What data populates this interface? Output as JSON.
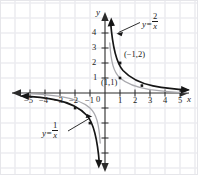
{
  "figure": {
    "kind": "cartesian-graph",
    "background_color": "#ffffff",
    "grid_color": "#ededf0",
    "axis_color": "#2b2b2b",
    "border_color": "#e6e6ea"
  },
  "axes": {
    "x_name": "x",
    "y_name": "y",
    "origin_label": "0",
    "x_ticks": [
      {
        "value": -5,
        "label": "−5"
      },
      {
        "value": -4,
        "label": "−4"
      },
      {
        "value": -3,
        "label": "−3"
      },
      {
        "value": -2,
        "label": "−2"
      },
      {
        "value": -1,
        "label": "−1"
      },
      {
        "value": 1,
        "label": "1"
      },
      {
        "value": 2,
        "label": "2"
      },
      {
        "value": 3,
        "label": "3"
      },
      {
        "value": 4,
        "label": "4"
      },
      {
        "value": 5,
        "label": "5"
      }
    ],
    "y_ticks": [
      {
        "value": 4,
        "label": "4"
      },
      {
        "value": 3,
        "label": "3"
      },
      {
        "value": 2,
        "label": "2"
      },
      {
        "value": 1,
        "label": "1"
      },
      {
        "value": -1,
        "label": ""
      },
      {
        "value": -2,
        "label": ""
      },
      {
        "value": -3,
        "label": ""
      },
      {
        "value": -4,
        "label": ""
      }
    ],
    "xlim": [
      -6.6,
      6.1
    ],
    "ylim": [
      -5.2,
      5.3
    ],
    "grid": true
  },
  "curves": [
    {
      "name": "y = 2/x",
      "label_numerator": "2",
      "label_denominator": "x",
      "label_lhs": "y",
      "label_eq": "=",
      "color": "#161616",
      "width": 1.6,
      "a": 2
    },
    {
      "name": "y = 1/x",
      "label_numerator": "1",
      "label_denominator": "x",
      "label_lhs": "y",
      "label_eq": "=",
      "color": "#a9a9ae",
      "width": 1.3,
      "a": 1
    }
  ],
  "annotations": [
    {
      "name": "point-label-neg1-2",
      "text": "(−1,2)"
    },
    {
      "name": "point-label-1-1",
      "text": "(1,1)"
    }
  ],
  "markers": [
    {
      "name": "marker-on-2x-at-1",
      "x": 1,
      "y": 2
    },
    {
      "name": "marker-on-2x-at-25",
      "x": 2.5,
      "y": 0.8
    },
    {
      "name": "marker-on-1x-at-1",
      "x": 1,
      "y": 1
    },
    {
      "name": "marker-on-2x-at-neg2",
      "x": -2,
      "y": -1
    },
    {
      "name": "marker-on-2x-at-neg1",
      "x": -1,
      "y": -2
    }
  ]
}
